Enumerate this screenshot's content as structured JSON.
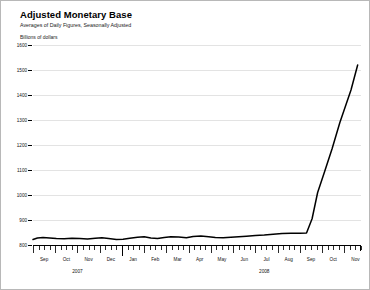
{
  "chart_data": {
    "type": "line",
    "title": "Adjusted Monetary Base",
    "subtitle": "Averages of Daily Figures, Seasonally Adjusted",
    "ylabel": "Billions of dollars",
    "xlabel": "",
    "ylim": [
      800,
      1600
    ],
    "grid": true,
    "legend": "none",
    "ytick_labels": [
      "1600",
      "1500",
      "1400",
      "1300",
      "1200",
      "1100",
      "1000",
      "900",
      "800"
    ],
    "ytick_values": [
      1600,
      1500,
      1400,
      1300,
      1200,
      1100,
      1000,
      900,
      800
    ],
    "month_labels": [
      "Sep",
      "Oct",
      "Nov",
      "Dec",
      "Jan",
      "Feb",
      "Mar",
      "Apr",
      "May",
      "Jun",
      "Jul",
      "Aug",
      "Sep",
      "Oct",
      "Nov"
    ],
    "year_labels": [
      "2007",
      "2008"
    ],
    "x": [
      "2007-09",
      "2007-10",
      "2007-11",
      "2007-12",
      "2008-01",
      "2008-02",
      "2008-03",
      "2008-04",
      "2008-05",
      "2008-06",
      "2008-07",
      "2008-08",
      "2008-09",
      "2008-10",
      "2008-11"
    ],
    "values": [
      822,
      829,
      826,
      822,
      828,
      825,
      832,
      828,
      831,
      835,
      841,
      845,
      847,
      1210,
      1520
    ],
    "detailed_points": [
      {
        "x": 0.0,
        "y": 822
      },
      {
        "x": 0.2,
        "y": 828
      },
      {
        "x": 0.45,
        "y": 830
      },
      {
        "x": 0.75,
        "y": 828
      },
      {
        "x": 1.05,
        "y": 826
      },
      {
        "x": 1.4,
        "y": 825
      },
      {
        "x": 1.75,
        "y": 827
      },
      {
        "x": 2.1,
        "y": 826
      },
      {
        "x": 2.45,
        "y": 824
      },
      {
        "x": 2.8,
        "y": 827
      },
      {
        "x": 3.1,
        "y": 829
      },
      {
        "x": 3.4,
        "y": 826
      },
      {
        "x": 3.75,
        "y": 822
      },
      {
        "x": 4.05,
        "y": 823
      },
      {
        "x": 4.35,
        "y": 827
      },
      {
        "x": 4.7,
        "y": 831
      },
      {
        "x": 5.0,
        "y": 833
      },
      {
        "x": 5.3,
        "y": 828
      },
      {
        "x": 5.6,
        "y": 826
      },
      {
        "x": 5.9,
        "y": 830
      },
      {
        "x": 6.2,
        "y": 833
      },
      {
        "x": 6.55,
        "y": 832
      },
      {
        "x": 6.9,
        "y": 829
      },
      {
        "x": 7.2,
        "y": 834
      },
      {
        "x": 7.55,
        "y": 836
      },
      {
        "x": 7.9,
        "y": 833
      },
      {
        "x": 8.2,
        "y": 830
      },
      {
        "x": 8.55,
        "y": 829
      },
      {
        "x": 8.9,
        "y": 831
      },
      {
        "x": 9.25,
        "y": 833
      },
      {
        "x": 9.6,
        "y": 835
      },
      {
        "x": 10.0,
        "y": 838
      },
      {
        "x": 10.4,
        "y": 840
      },
      {
        "x": 10.8,
        "y": 843
      },
      {
        "x": 11.2,
        "y": 846
      },
      {
        "x": 11.6,
        "y": 847
      },
      {
        "x": 12.0,
        "y": 847
      },
      {
        "x": 12.3,
        "y": 848
      },
      {
        "x": 12.55,
        "y": 905
      },
      {
        "x": 12.8,
        "y": 1010
      },
      {
        "x": 13.1,
        "y": 1090
      },
      {
        "x": 13.45,
        "y": 1185
      },
      {
        "x": 13.8,
        "y": 1290
      },
      {
        "x": 14.05,
        "y": 1355
      },
      {
        "x": 14.3,
        "y": 1420
      },
      {
        "x": 14.6,
        "y": 1520
      }
    ],
    "series_color": "#000000",
    "grid_color": "#e3e3e3"
  }
}
